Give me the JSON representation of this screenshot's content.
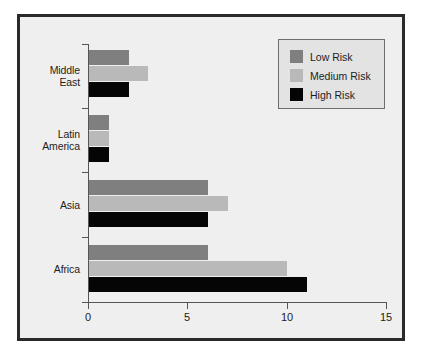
{
  "chart_data": {
    "type": "bar",
    "orientation": "horizontal",
    "title": "",
    "xlabel": "",
    "ylabel": "",
    "xlim": [
      0,
      15
    ],
    "xticks": [
      0,
      5,
      10,
      15
    ],
    "xtick_labels": [
      "0",
      "5",
      "10",
      "15"
    ],
    "grid": false,
    "legend_position": "top-right",
    "categories": [
      "Middle East",
      "Latin America",
      "Asia",
      "Africa"
    ],
    "category_labels": [
      "Middle\nEast",
      "Latin\nAmerica",
      "Asia",
      "Africa"
    ],
    "series": [
      {
        "name": "Low Risk",
        "color": "#7f7f7f",
        "values": [
          2,
          1,
          6,
          6
        ]
      },
      {
        "name": "Medium Risk",
        "color": "#b9b9b9",
        "values": [
          3,
          1,
          7,
          10
        ]
      },
      {
        "name": "High Risk",
        "color": "#050505",
        "values": [
          2,
          1,
          6,
          11
        ]
      }
    ]
  },
  "legend": {
    "items": [
      {
        "label": "Low Risk",
        "color": "#7f7f7f"
      },
      {
        "label": "Medium Risk",
        "color": "#b9b9b9"
      },
      {
        "label": "High Risk",
        "color": "#050505"
      }
    ]
  },
  "colors": {
    "background": "#efefef",
    "frame": "#2a2a2a",
    "axis": "#555555",
    "text": "#1d1d1d",
    "legend_background": "#e3e3e3",
    "legend_border": "#6e6e6e"
  }
}
